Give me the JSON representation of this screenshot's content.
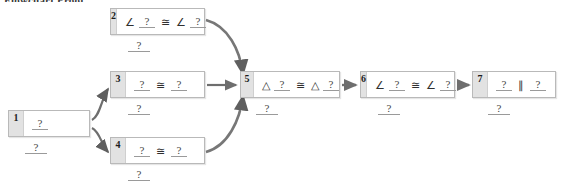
{
  "heading": "Flowchart Proof",
  "symbols": {
    "angle": "∠",
    "triangle": "△",
    "congruent": "≅",
    "parallel": "∥",
    "blank": "?"
  },
  "diagram": {
    "type": "flowchart-proof",
    "node_count": 7,
    "nodes": [
      {
        "id": 1,
        "number": "1",
        "x": 8,
        "y": 110,
        "w": 82,
        "h": 27,
        "statement_tokens": [
          "?"
        ],
        "statement_text": "?",
        "reason": "?",
        "reason_x": 25,
        "reason_y": 142
      },
      {
        "id": 2,
        "number": "2",
        "x": 110,
        "y": 8,
        "w": 95,
        "h": 27,
        "statement_tokens": [
          "∠",
          "?",
          "≅",
          "∠",
          "?"
        ],
        "statement_text": "∠ ? ≅ ∠ ?",
        "reason": "?",
        "reason_x": 128,
        "reason_y": 40
      },
      {
        "id": 3,
        "number": "3",
        "x": 110,
        "y": 71,
        "w": 95,
        "h": 27,
        "statement_tokens": [
          "?",
          "≅",
          "?"
        ],
        "statement_text": "? ≅ ?",
        "reason": "?",
        "reason_x": 128,
        "reason_y": 103
      },
      {
        "id": 4,
        "number": "4",
        "x": 110,
        "y": 137,
        "w": 95,
        "h": 27,
        "statement_tokens": [
          "?",
          "≅",
          "?"
        ],
        "statement_text": "? ≅ ?",
        "reason": "?",
        "reason_x": 128,
        "reason_y": 169
      },
      {
        "id": 5,
        "number": "5",
        "x": 240,
        "y": 71,
        "w": 100,
        "h": 27,
        "statement_tokens": [
          "△",
          "?",
          "≅",
          "△",
          "?"
        ],
        "statement_text": "△ ? ≅ △ ?",
        "reason": "?",
        "reason_x": 256,
        "reason_y": 103
      },
      {
        "id": 6,
        "number": "6",
        "x": 360,
        "y": 71,
        "w": 95,
        "h": 27,
        "statement_tokens": [
          "∠",
          "?",
          "≅",
          "∠",
          "?"
        ],
        "statement_text": "∠ ? ≅ ∠ ?",
        "reason": "?",
        "reason_x": 378,
        "reason_y": 103
      },
      {
        "id": 7,
        "number": "7",
        "x": 472,
        "y": 71,
        "w": 84,
        "h": 27,
        "statement_tokens": [
          "?",
          "∥",
          "?"
        ],
        "statement_text": "? ∥ ?",
        "reason": "?",
        "reason_x": 488,
        "reason_y": 103
      }
    ],
    "edges": [
      {
        "from": 1,
        "to": 3,
        "style": "curved"
      },
      {
        "from": 1,
        "to": 4,
        "style": "curved"
      },
      {
        "from": 2,
        "to": 5,
        "style": "curved"
      },
      {
        "from": 3,
        "to": 5,
        "style": "straight"
      },
      {
        "from": 4,
        "to": 5,
        "style": "curved"
      },
      {
        "from": 5,
        "to": 6,
        "style": "straight"
      },
      {
        "from": 6,
        "to": 7,
        "style": "straight"
      }
    ]
  },
  "colors": {
    "box_border": "#b9b9b9",
    "badge_bg": "#e2e2e2",
    "arrow": "#6e6e6e",
    "text": "#2f2f2f",
    "blank_rule": "#9a9a9a",
    "page_bg": "#ffffff"
  }
}
